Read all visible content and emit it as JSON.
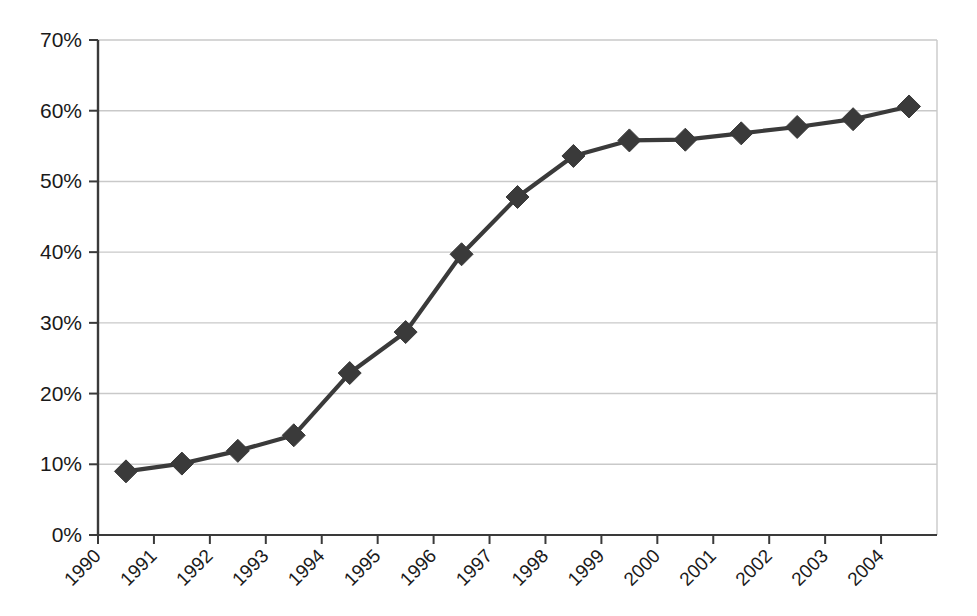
{
  "chart_data": {
    "type": "line",
    "title": "",
    "subtitle": "",
    "xlabel": "",
    "ylabel": "",
    "grid": "horizontal",
    "legend": "none",
    "marker": "diamond",
    "series_color": "#3a3a3a",
    "grid_color": "#c9c9c9",
    "axis_color": "#3a3a3a",
    "xlim": [
      1990,
      2005
    ],
    "ylim": [
      0,
      70
    ],
    "ytick_labels": [
      "70%",
      "60%",
      "50%",
      "40%",
      "30%",
      "20%",
      "10%",
      "0%"
    ],
    "ytick_values": [
      70,
      60,
      50,
      40,
      30,
      20,
      10,
      0
    ],
    "xtick_labels": [
      "1990",
      "1991",
      "1992",
      "1993",
      "1994",
      "1995",
      "1996",
      "1997",
      "1998",
      "1999",
      "2000",
      "2001",
      "2002",
      "2003",
      "2004"
    ],
    "xtick_values": [
      1990,
      1991,
      1992,
      1993,
      1994,
      1995,
      1996,
      1997,
      1998,
      1999,
      2000,
      2001,
      2002,
      2003,
      2004
    ],
    "x": [
      1990.5,
      1991.5,
      1992.5,
      1993.5,
      1994.5,
      1995.5,
      1996.5,
      1997.5,
      1998.5,
      1999.5,
      2000.5,
      2001.5,
      2002.5,
      2003.5,
      2004.5
    ],
    "values": [
      9.0,
      10.1,
      11.9,
      14.1,
      22.9,
      28.7,
      39.7,
      47.8,
      53.6,
      55.8,
      55.9,
      56.8,
      57.7,
      58.8,
      60.6
    ],
    "series": [
      {
        "name": "",
        "values": [
          9.0,
          10.1,
          11.9,
          14.1,
          22.9,
          28.7,
          39.7,
          47.8,
          53.6,
          55.8,
          55.9,
          56.8,
          57.7,
          58.8,
          60.6
        ]
      }
    ]
  }
}
